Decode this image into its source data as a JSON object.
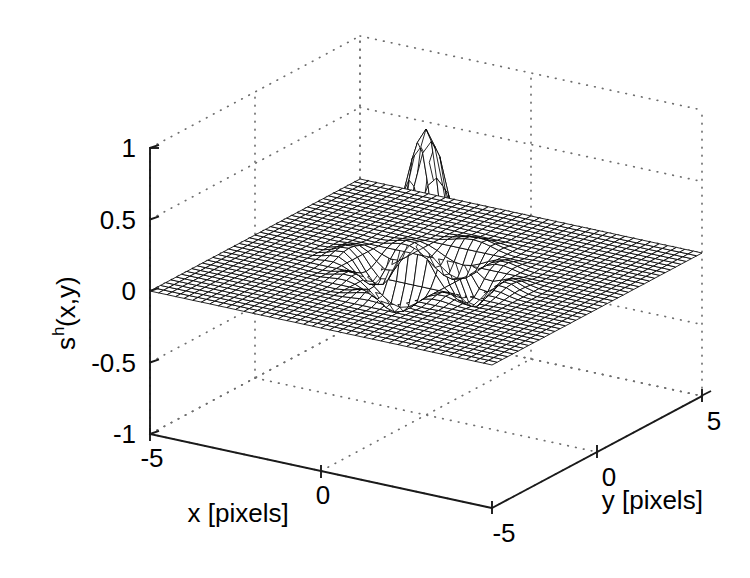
{
  "figure": {
    "kind": "matlab-mesh-surface-3d",
    "background_color": "#ffffff",
    "line_color": "#000000",
    "grid_color": "#6e6e6e",
    "face_color": "#ffffff"
  },
  "axes": {
    "x": {
      "title": "x [pixels]",
      "ticks": [
        "-5",
        "0"
      ],
      "tick_values": [
        -5,
        0
      ],
      "range": [
        -5,
        5
      ]
    },
    "y": {
      "title": "y [pixels]",
      "ticks": [
        "-5",
        "0",
        "5"
      ],
      "tick_values": [
        -5,
        0,
        5
      ],
      "range": [
        -5,
        5
      ]
    },
    "z": {
      "title_base": "s",
      "title_sup": "h",
      "title_tail": "(x,y)",
      "title": "s^h(x,y)",
      "ticks": [
        "1",
        "0.5",
        "0",
        "-0.5",
        "-1"
      ],
      "tick_values": [
        1,
        0.5,
        0,
        -0.5,
        -1
      ],
      "range": [
        -1,
        1
      ]
    }
  },
  "chart_data": {
    "type": "surface",
    "title": "",
    "xlabel": "x [pixels]",
    "ylabel": "y [pixels]",
    "zlabel": "s^h(x,y)",
    "xlim": [
      -5,
      5
    ],
    "ylim": [
      -5,
      5
    ],
    "zlim": [
      -1,
      1
    ],
    "xticks": [
      -5,
      0
    ],
    "yticks": [
      -5,
      0,
      5
    ],
    "zticks": [
      -1,
      -0.5,
      0,
      0.5,
      1
    ],
    "grid": true,
    "legend": "none",
    "mesh_n": 41,
    "shading": "mesh-white-faces-black-lines",
    "view": {
      "azimuth_deg": -37.5,
      "elevation_deg": 22
    },
    "surface_model": {
      "formula": "separable-sinc-like kernel: f(x,y) = k(x)*k(y), k(t) = sin(pi*t)/(pi*t) windowed",
      "peak_value": 1.0,
      "peak_position": [
        0,
        0
      ],
      "negative_lobe_min": -0.13,
      "plane_level": 0.0
    },
    "samples": {
      "x": [
        -5,
        -4,
        -3,
        -2,
        -1,
        0,
        1,
        2,
        3,
        4,
        5
      ],
      "z_along_y0": [
        0,
        0,
        0,
        0,
        0,
        1.0,
        0,
        0,
        0,
        0,
        0
      ]
    }
  }
}
